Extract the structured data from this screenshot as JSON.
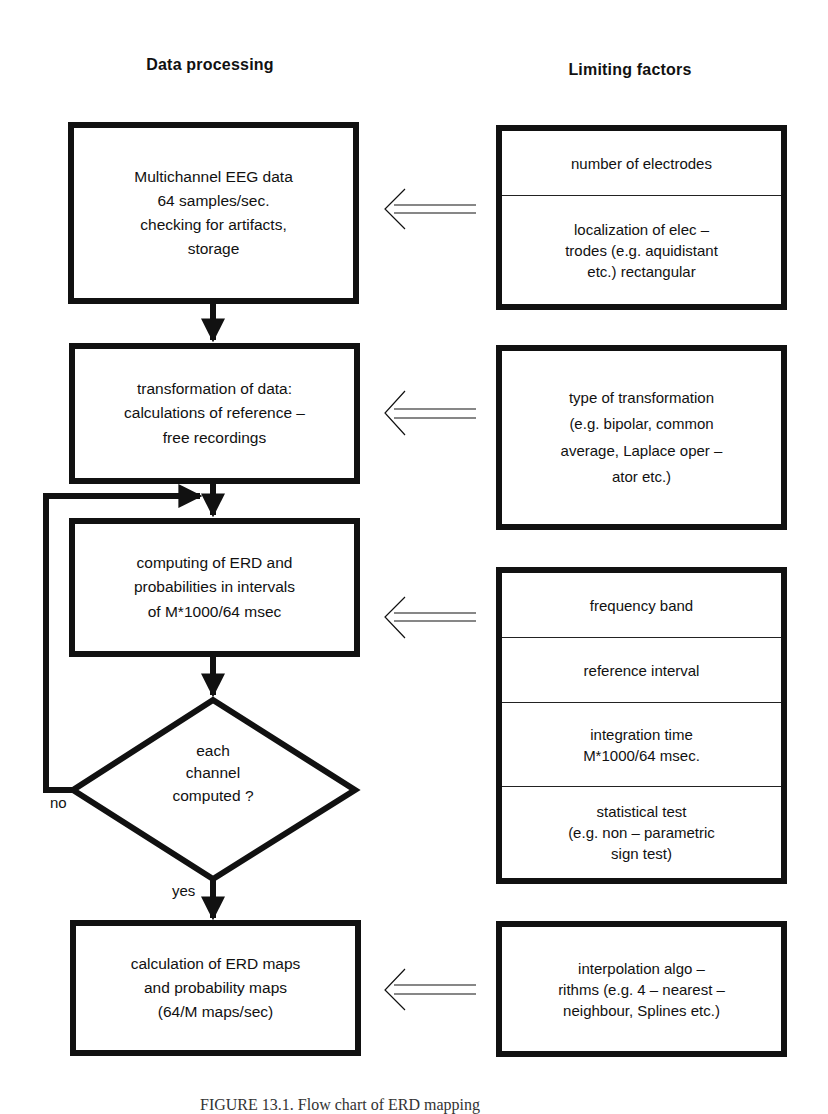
{
  "headings": {
    "left": "Data processing",
    "right": "Limiting factors"
  },
  "process": {
    "step1": {
      "lines": [
        "Multichannel EEG data",
        "64 samples/sec.",
        "checking for artifacts,",
        "storage"
      ]
    },
    "step2": {
      "lines": [
        "transformation of data:",
        "calculations of reference –",
        "free recordings"
      ]
    },
    "step3": {
      "lines": [
        "computing of ERD and",
        "probabilities in intervals",
        "of M*1000/64 msec"
      ]
    },
    "decision": {
      "lines": [
        "each",
        "channel",
        "computed ?"
      ],
      "no_label": "no",
      "yes_label": "yes"
    },
    "step4": {
      "lines": [
        "calculation of ERD maps",
        "and probability maps",
        "(64/M maps/sec)"
      ]
    }
  },
  "factors": {
    "group1": [
      {
        "lines": [
          "number of electrodes"
        ]
      },
      {
        "lines": [
          "localization of elec –",
          "trodes (e.g. aquidistant",
          "etc.) rectangular"
        ]
      }
    ],
    "group2": [
      {
        "lines": [
          "type of transformation",
          "(e.g. bipolar, common",
          "average, Laplace oper –",
          "ator etc.)"
        ]
      }
    ],
    "group3": [
      {
        "lines": [
          "frequency band"
        ]
      },
      {
        "lines": [
          "reference interval"
        ]
      },
      {
        "lines": [
          "integration time",
          "M*1000/64 msec."
        ]
      },
      {
        "lines": [
          "statistical test",
          "(e.g. non – parametric",
          "sign test)"
        ]
      }
    ],
    "group4": [
      {
        "lines": [
          "interpolation algo –",
          "rithms (e.g. 4 – nearest –",
          "neighbour, Splines etc.)"
        ]
      }
    ]
  },
  "icons": {
    "influence_arrow": "double-line-left-arrow",
    "flow_arrow": "down-arrow"
  },
  "caption": "FIGURE 13.1. Flow chart of ERD mapping"
}
